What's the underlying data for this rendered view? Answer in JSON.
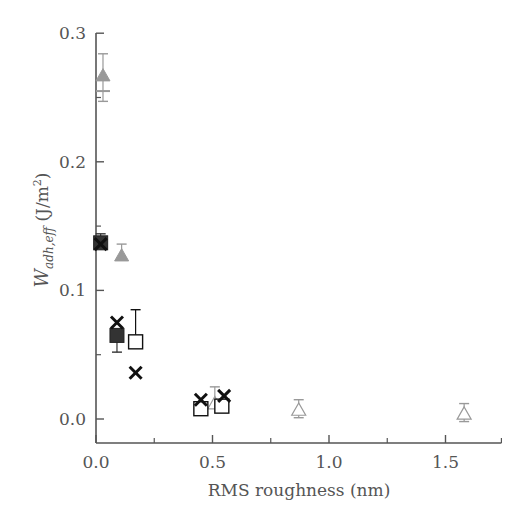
{
  "chart_data": {
    "type": "scatter",
    "title": "",
    "xlabel": "RMS roughness (nm)",
    "ylabel": "W_adh,eff (J/m^2)",
    "ylabel_parts": {
      "main": "W",
      "sub": "adh,eff",
      "unit_pre": " (J/m",
      "sup": "2",
      "unit_post": ")"
    },
    "xlim": [
      0.0,
      1.74
    ],
    "ylim": [
      -0.019,
      0.3
    ],
    "xticks": [
      0.0,
      0.5,
      1.0,
      1.5
    ],
    "xtick_labels": [
      "0.0",
      "0.5",
      "1.0",
      "1.5"
    ],
    "xminor": [
      0.25,
      0.75,
      1.25,
      1.74
    ],
    "yticks": [
      0.0,
      0.1,
      0.2,
      0.3
    ],
    "ytick_labels": [
      "0.0",
      "0.1",
      "0.2",
      "0.3"
    ],
    "yminor": [
      0.05,
      0.15,
      0.25
    ],
    "grid": false,
    "legend": null,
    "series": [
      {
        "name": "filled gray triangle",
        "marker": "triangle-filled",
        "color": "#999999",
        "points": [
          {
            "x": 0.03,
            "y": 0.267,
            "err_lo": 0.02,
            "err_hi": 0.017
          },
          {
            "x": 0.11,
            "y": 0.127,
            "err_lo": 0.0,
            "err_hi": 0.009
          }
        ]
      },
      {
        "name": "gray bar marker",
        "marker": "hline",
        "color": "#999999",
        "points": [
          {
            "x": 0.03,
            "y": 0.255
          }
        ]
      },
      {
        "name": "filled dark square",
        "marker": "square-filled",
        "color": "#333333",
        "points": [
          {
            "x": 0.02,
            "y": 0.137,
            "err_lo": 0.0,
            "err_hi": 0.007
          },
          {
            "x": 0.09,
            "y": 0.065,
            "err_lo": 0.013,
            "err_hi": 0.0
          }
        ]
      },
      {
        "name": "open square",
        "marker": "square-open",
        "color": "#111111",
        "points": [
          {
            "x": 0.17,
            "y": 0.06,
            "err_lo": 0.0,
            "err_hi": 0.025
          },
          {
            "x": 0.45,
            "y": 0.008,
            "err_lo": 0.0,
            "err_hi": 0.0
          },
          {
            "x": 0.54,
            "y": 0.01,
            "err_lo": 0.0,
            "err_hi": 0.0
          }
        ]
      },
      {
        "name": "cross",
        "marker": "x",
        "color": "#111111",
        "points": [
          {
            "x": 0.02,
            "y": 0.136
          },
          {
            "x": 0.09,
            "y": 0.075
          },
          {
            "x": 0.17,
            "y": 0.036
          },
          {
            "x": 0.45,
            "y": 0.015
          },
          {
            "x": 0.55,
            "y": 0.018
          }
        ]
      },
      {
        "name": "open gray triangle",
        "marker": "triangle-open",
        "color": "#999999",
        "points": [
          {
            "x": 0.51,
            "y": 0.012,
            "err_lo": 0.0,
            "err_hi": 0.013
          },
          {
            "x": 0.87,
            "y": 0.007,
            "err_lo": 0.006,
            "err_hi": 0.008
          },
          {
            "x": 1.58,
            "y": 0.004,
            "err_lo": 0.006,
            "err_hi": 0.008
          }
        ]
      }
    ]
  }
}
